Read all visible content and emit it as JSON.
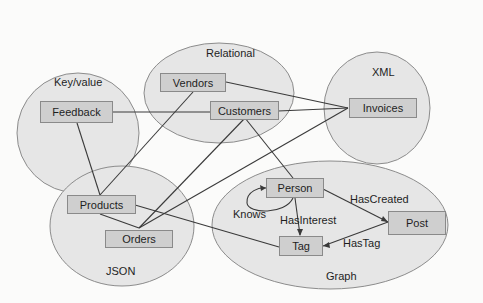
{
  "diagram": {
    "groups": [
      {
        "id": "keyvalue",
        "label": "Key/value"
      },
      {
        "id": "relational",
        "label": "Relational"
      },
      {
        "id": "xml",
        "label": "XML"
      },
      {
        "id": "json",
        "label": "JSON"
      },
      {
        "id": "graph",
        "label": "Graph"
      }
    ],
    "nodes": {
      "feedback": "Feedback",
      "vendors": "Vendors",
      "customers": "Customers",
      "invoices": "Invoices",
      "products": "Products",
      "orders": "Orders",
      "person": "Person",
      "tag": "Tag",
      "post": "Post"
    },
    "edge_labels": {
      "knows": "Knows",
      "has_interest": "HasInterest",
      "has_created": "HasCreated",
      "has_tag": "HasTag"
    },
    "colors": {
      "ellipse_fill": "#e6e6e6",
      "ellipse_stroke": "#8c8c8c",
      "box_fill": "#cfcfcf",
      "line": "#3a3a3a"
    }
  }
}
